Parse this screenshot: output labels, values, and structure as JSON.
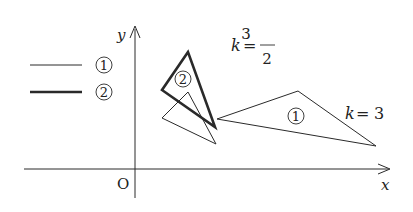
{
  "legend": {
    "items": [
      {
        "marker": "①",
        "line_style": "thin"
      },
      {
        "marker": "②",
        "line_style": "thick"
      }
    ]
  },
  "axes": {
    "x_label": "x",
    "y_label": "y",
    "origin_label": "O"
  },
  "figures": {
    "triangle_1": {
      "marker": "①",
      "k_label": "k = 3",
      "k_var": "k",
      "k_eq": "=",
      "k_value": "3"
    },
    "triangle_2": {
      "marker": "②",
      "k_label": "k = 3/2",
      "k_var": "k",
      "k_eq": "=",
      "k_num": "3",
      "k_den": "2"
    }
  },
  "colors": {
    "line": "#2a2a2a",
    "background": "#ffffff"
  }
}
